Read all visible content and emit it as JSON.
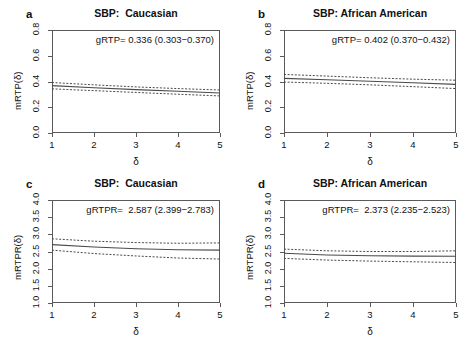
{
  "figure": {
    "background": "#ffffff",
    "line_color": "#4a4a4a",
    "axis_color": "#5a5a5a"
  },
  "panels": [
    {
      "letter": "a",
      "title": "SBP:  Caucasian",
      "annotation": "gRTP= 0.336 (0.303−0.370)",
      "ylabel": "mRTP(δ)",
      "xlabel": "δ"
    },
    {
      "letter": "b",
      "title": "SBP: African American",
      "annotation": "gRTP= 0.402 (0.370−0.432)",
      "ylabel": "mRTP(δ)",
      "xlabel": "δ"
    },
    {
      "letter": "c",
      "title": "SBP:  Caucasian",
      "annotation": "gRTPR=  2.587 (2.399−2.783)",
      "ylabel": "mRTPR(δ)",
      "xlabel": "δ"
    },
    {
      "letter": "d",
      "title": "SBP: African American",
      "annotation": "gRTPR=  2.373 (2.235−2.523)",
      "ylabel": "mRTPR(δ)",
      "xlabel": "δ"
    }
  ],
  "chart_data": [
    {
      "type": "line",
      "panel": "a",
      "title": "SBP:  Caucasian",
      "xlabel": "δ",
      "ylabel": "mRTP(δ)",
      "xlim": [
        1,
        5
      ],
      "ylim": [
        0.0,
        0.8
      ],
      "xticks": [
        1,
        2,
        3,
        4,
        5
      ],
      "yticks": [
        0.0,
        0.2,
        0.4,
        0.6,
        0.8
      ],
      "grid": false,
      "legend": null,
      "annotation": "gRTP= 0.336 (0.303−0.370)",
      "x": [
        1,
        2,
        3,
        4,
        5
      ],
      "series": [
        {
          "name": "mRTP estimate",
          "style": "solid",
          "values": [
            0.368,
            0.352,
            0.337,
            0.324,
            0.311
          ]
        },
        {
          "name": "upper 95% CI",
          "style": "dashed",
          "values": [
            0.392,
            0.374,
            0.358,
            0.345,
            0.334
          ]
        },
        {
          "name": "lower 95% CI",
          "style": "dashed",
          "values": [
            0.343,
            0.329,
            0.315,
            0.301,
            0.288
          ]
        }
      ]
    },
    {
      "type": "line",
      "panel": "b",
      "title": "SBP: African American",
      "xlabel": "δ",
      "ylabel": "mRTP(δ)",
      "xlim": [
        1,
        5
      ],
      "ylim": [
        0.0,
        0.8
      ],
      "xticks": [
        1,
        2,
        3,
        4,
        5
      ],
      "yticks": [
        0.0,
        0.2,
        0.4,
        0.6,
        0.8
      ],
      "grid": false,
      "legend": null,
      "annotation": "gRTP= 0.402 (0.370−0.432)",
      "x": [
        1,
        2,
        3,
        4,
        5
      ],
      "series": [
        {
          "name": "mRTP estimate",
          "style": "solid",
          "values": [
            0.424,
            0.414,
            0.402,
            0.39,
            0.378
          ]
        },
        {
          "name": "upper 95% CI",
          "style": "dashed",
          "values": [
            0.455,
            0.442,
            0.429,
            0.418,
            0.41
          ]
        },
        {
          "name": "lower 95% CI",
          "style": "dashed",
          "values": [
            0.396,
            0.386,
            0.374,
            0.36,
            0.345
          ]
        }
      ]
    },
    {
      "type": "line",
      "panel": "c",
      "title": "SBP:  Caucasian",
      "xlabel": "δ",
      "ylabel": "mRTPR(δ)",
      "xlim": [
        1,
        5
      ],
      "ylim": [
        1.0,
        4.0
      ],
      "xticks": [
        1,
        2,
        3,
        4,
        5
      ],
      "yticks": [
        1.0,
        1.5,
        2.0,
        2.5,
        3.0,
        3.5,
        4.0
      ],
      "grid": false,
      "legend": null,
      "annotation": "gRTPR=  2.587 (2.399−2.783)",
      "x": [
        1,
        2,
        3,
        4,
        5
      ],
      "series": [
        {
          "name": "mRTPR estimate",
          "style": "solid",
          "values": [
            2.7,
            2.63,
            2.58,
            2.55,
            2.54
          ]
        },
        {
          "name": "upper 95% CI",
          "style": "dashed",
          "values": [
            2.87,
            2.8,
            2.76,
            2.74,
            2.75
          ]
        },
        {
          "name": "lower 95% CI",
          "style": "dashed",
          "values": [
            2.54,
            2.44,
            2.37,
            2.31,
            2.28
          ]
        }
      ]
    },
    {
      "type": "line",
      "panel": "d",
      "title": "SBP: African American",
      "xlabel": "δ",
      "ylabel": "mRTPR(δ)",
      "xlim": [
        1,
        5
      ],
      "ylim": [
        1.0,
        4.0
      ],
      "xticks": [
        1,
        2,
        3,
        4,
        5
      ],
      "yticks": [
        1.0,
        1.5,
        2.0,
        2.5,
        3.0,
        3.5,
        4.0
      ],
      "grid": false,
      "legend": null,
      "annotation": "gRTPR=  2.373 (2.235−2.523)",
      "x": [
        1,
        2,
        3,
        4,
        5
      ],
      "series": [
        {
          "name": "mRTPR estimate",
          "style": "solid",
          "values": [
            2.45,
            2.4,
            2.375,
            2.365,
            2.36
          ]
        },
        {
          "name": "upper 95% CI",
          "style": "dashed",
          "values": [
            2.57,
            2.52,
            2.5,
            2.5,
            2.52
          ]
        },
        {
          "name": "lower 95% CI",
          "style": "dashed",
          "values": [
            2.3,
            2.25,
            2.22,
            2.2,
            2.18
          ]
        }
      ]
    }
  ]
}
